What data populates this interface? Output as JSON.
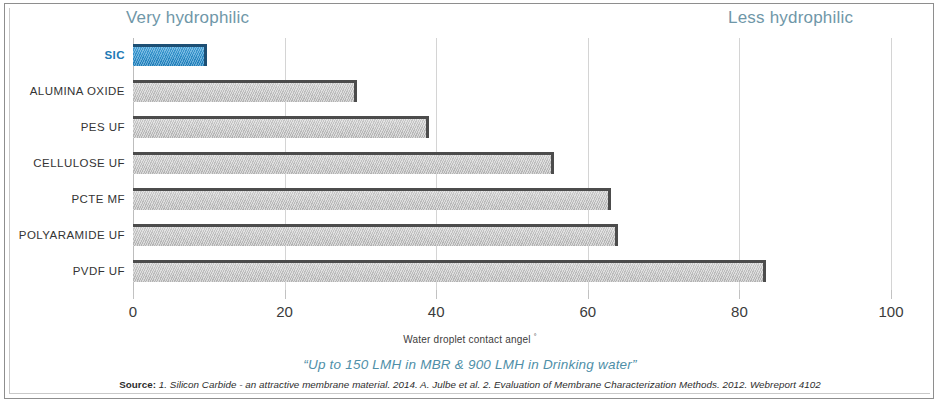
{
  "annotations": {
    "left_note": "Very hydrophilic",
    "right_note": "Less hydrophilic"
  },
  "footer": {
    "tagline": "“Up to 150 LMH in MBR & 900 LMH in Drinking water”",
    "source_label": "Source:",
    "source_text": "1. Silicon Carbide - an attractive membrane material. 2014. A. Julbe et al. 2. Evaluation of Membrane Characterization Methods. 2012. Webreport 4102"
  },
  "colors": {
    "accent": "#2f93d0",
    "accent_label": "#2079b5",
    "bar_gray": "#c4c4c4",
    "bar_edge": "#4c4c4c",
    "note_text": "#6f97a8",
    "tagline_text": "#4f8fa8",
    "gridline": "#d4d4d4"
  },
  "chart_data": {
    "type": "bar",
    "orientation": "horizontal",
    "title": "",
    "subtitle": "",
    "xlabel": "Water droplet contact angel °",
    "ylabel": "",
    "xlim": [
      0,
      100
    ],
    "xticks": [
      0,
      20,
      40,
      60,
      80,
      100
    ],
    "xtick_labels": [
      "0",
      "20",
      "40",
      "60",
      "80",
      "100"
    ],
    "grid": true,
    "legend": false,
    "categories": [
      "SIC",
      "ALUMINA OXIDE",
      "PES UF",
      "CELLULOSE UF",
      "PCTE MF",
      "POLYARAMIDE UF",
      "PVDF UF"
    ],
    "values": [
      9.8,
      29.5,
      39,
      55.5,
      63,
      64,
      83.5
    ],
    "highlight_category": "SIC",
    "annotations": [
      "Very hydrophilic",
      "Less hydrophilic"
    ]
  }
}
